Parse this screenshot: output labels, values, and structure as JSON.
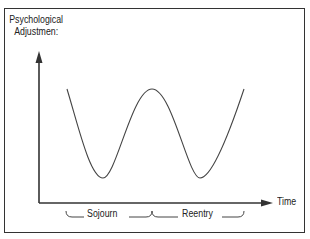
{
  "diagram": {
    "title": "",
    "y_axis": {
      "label_line1": "Psychological",
      "label_line2": "Adjustmen:"
    },
    "x_axis": {
      "label": "Time"
    },
    "phases": [
      {
        "label": "Sojourn"
      },
      {
        "label": "Reentry"
      }
    ],
    "curve_description": "W-curve: high at start, dips to trough during sojourn, rises to peak at transition, dips to trough during reentry, rises again",
    "colors": {
      "line": "#333333",
      "text": "#222222",
      "background": "#ffffff"
    }
  }
}
